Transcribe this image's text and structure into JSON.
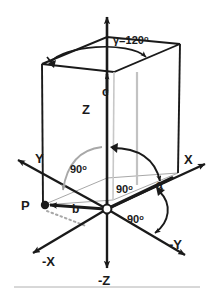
{
  "figure": {
    "colors": {
      "stroke_dark": "#1a1a1a",
      "stroke_gray": "#9a9a9a",
      "background": "#ffffff",
      "rule": "#b0b0b0"
    },
    "axes": [
      {
        "id": "z",
        "label": "Z",
        "direction": "up"
      },
      {
        "id": "neg-z",
        "label": "-Z",
        "direction": "down"
      },
      {
        "id": "x",
        "label": "X",
        "direction": "up-right"
      },
      {
        "id": "neg-x",
        "label": "-X",
        "direction": "down-left"
      },
      {
        "id": "y",
        "label": "Y",
        "direction": "up-left"
      },
      {
        "id": "neg-y",
        "label": "-Y",
        "direction": "down-right"
      }
    ],
    "vectors": [
      {
        "id": "a",
        "label": "a",
        "note": "along +X toward lower-right base corner"
      },
      {
        "id": "b",
        "label": "b",
        "note": "toward point P on the left"
      },
      {
        "id": "c",
        "label": "c",
        "note": "along +Z upward"
      }
    ],
    "points": [
      {
        "id": "P",
        "label": "P"
      },
      {
        "id": "origin",
        "label": ""
      }
    ],
    "angles": [
      {
        "id": "gamma",
        "label": "γ=120",
        "degree_symbol": "o",
        "value": 120,
        "unit": "degrees"
      },
      {
        "id": "angle-a-z",
        "label": "90",
        "degree_symbol": "o",
        "value": 90,
        "unit": "degrees"
      },
      {
        "id": "angle-b-z",
        "label": "90",
        "degree_symbol": "o",
        "value": 90,
        "unit": "degrees"
      },
      {
        "id": "angle-a-negy",
        "label": "90",
        "degree_symbol": "o",
        "value": 90,
        "unit": "degrees"
      }
    ]
  }
}
